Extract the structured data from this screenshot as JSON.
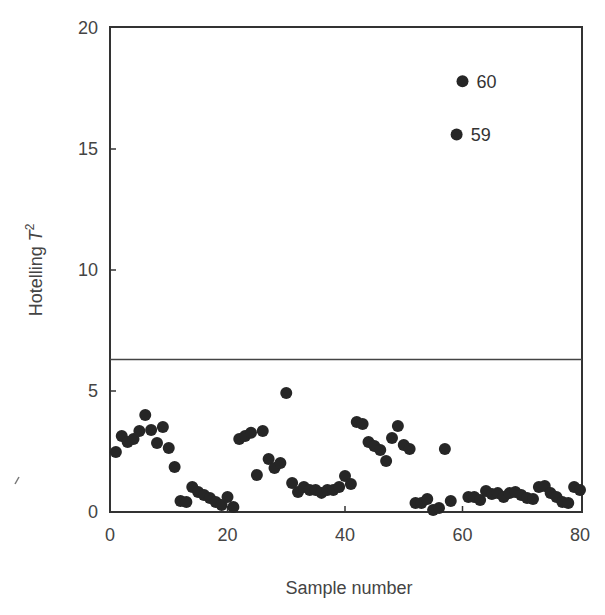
{
  "chart_data": {
    "type": "scatter",
    "title": "",
    "xlabel": "Sample number",
    "ylabel": "Hotelling T²",
    "ylabel_base": "Hotelling ",
    "ylabel_var": "T",
    "ylabel_sup": "2",
    "xlim": [
      0,
      81
    ],
    "ylim": [
      0,
      20
    ],
    "xticks": [
      0,
      20,
      40,
      60,
      80
    ],
    "yticks": [
      0,
      5,
      10,
      15,
      20
    ],
    "grid": false,
    "legend": null,
    "threshold": {
      "value": 6.3,
      "label": "control limit"
    },
    "annotations": [
      {
        "x": 59,
        "y": 15.6,
        "text": "59"
      },
      {
        "x": 60,
        "y": 17.8,
        "text": "60"
      }
    ],
    "x": [
      1,
      2,
      3,
      4,
      5,
      6,
      7,
      8,
      9,
      10,
      11,
      12,
      13,
      14,
      15,
      16,
      17,
      18,
      19,
      20,
      21,
      22,
      23,
      24,
      25,
      26,
      27,
      28,
      29,
      30,
      31,
      32,
      33,
      34,
      35,
      36,
      37,
      38,
      39,
      40,
      41,
      42,
      43,
      44,
      45,
      46,
      47,
      48,
      49,
      50,
      51,
      52,
      53,
      54,
      55,
      56,
      57,
      58,
      59,
      60,
      61,
      62,
      63,
      64,
      65,
      66,
      67,
      68,
      69,
      70,
      71,
      72,
      73,
      74,
      75,
      76,
      77,
      78,
      79,
      80
    ],
    "values": [
      2.48,
      3.14,
      2.89,
      3.02,
      3.35,
      4.01,
      3.39,
      2.85,
      3.51,
      2.64,
      1.86,
      0.45,
      0.41,
      1.03,
      0.83,
      0.7,
      0.58,
      0.41,
      0.29,
      0.62,
      0.21,
      3.02,
      3.14,
      3.27,
      1.53,
      3.35,
      2.19,
      1.82,
      2.02,
      4.92,
      1.2,
      0.83,
      1.03,
      0.91,
      0.91,
      0.79,
      0.91,
      0.91,
      1.03,
      1.49,
      1.16,
      3.72,
      3.64,
      2.89,
      2.73,
      2.56,
      2.11,
      3.06,
      3.55,
      2.77,
      2.6,
      0.37,
      0.37,
      0.54,
      0.08,
      0.17,
      2.6,
      0.45,
      15.6,
      17.8,
      0.62,
      0.62,
      0.5,
      0.87,
      0.74,
      0.78,
      0.62,
      0.78,
      0.83,
      0.7,
      0.58,
      0.54,
      1.03,
      1.07,
      0.78,
      0.62,
      0.41,
      0.37,
      1.03,
      0.91
    ],
    "marker_color": "#262626",
    "line_color": "#333333"
  },
  "axes": {
    "x_ticks": [
      {
        "value": 0,
        "label": "0"
      },
      {
        "value": 20,
        "label": "20"
      },
      {
        "value": 40,
        "label": "40"
      },
      {
        "value": 60,
        "label": "60"
      },
      {
        "value": 80,
        "label": "80"
      }
    ],
    "y_ticks": [
      {
        "value": 0,
        "label": "0"
      },
      {
        "value": 5,
        "label": "5"
      },
      {
        "value": 10,
        "label": "10"
      },
      {
        "value": 15,
        "label": "15"
      },
      {
        "value": 20,
        "label": "20"
      }
    ]
  }
}
